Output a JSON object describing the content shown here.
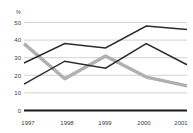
{
  "chart_data": {
    "type": "line",
    "title": "",
    "subtitle": "",
    "xlabel": "",
    "ylabel": "%",
    "unit_label": "%",
    "categories": [
      "1997",
      "1998",
      "1999",
      "2000",
      "2001"
    ],
    "x": [
      1997,
      1998,
      1999,
      2000,
      2001
    ],
    "ylim": [
      0,
      50
    ],
    "yticks": [
      0,
      10,
      20,
      30,
      40,
      50
    ],
    "ytick_labels": [
      "0",
      "10",
      "20",
      "30",
      "40",
      "50"
    ],
    "xtick_labels": [
      "1997",
      "1998",
      "1999",
      "2000",
      "2001"
    ],
    "grid": true,
    "grid_axis": "y",
    "legend": false,
    "legend_position": "none",
    "series": [
      {
        "name": "series-1",
        "color": "#2b2b2b",
        "style": "thin-dark",
        "values": [
          27,
          38,
          35.5,
          48,
          46
        ]
      },
      {
        "name": "series-2",
        "color": "#2b2b2b",
        "style": "thin-dark",
        "values": [
          15,
          28,
          24,
          38,
          26
        ]
      },
      {
        "name": "series-3",
        "color": "#b0b0b0",
        "style": "thick-gray",
        "values": [
          38,
          18,
          31,
          19,
          14
        ]
      }
    ],
    "colors": {
      "grid": "#bfbfbf",
      "baseline": "#1a1a1a",
      "dark_series": "#2b2b2b",
      "gray_series": "#b0b0b0",
      "tick_text": "#3a3a3a",
      "background": "#ffffff"
    }
  }
}
